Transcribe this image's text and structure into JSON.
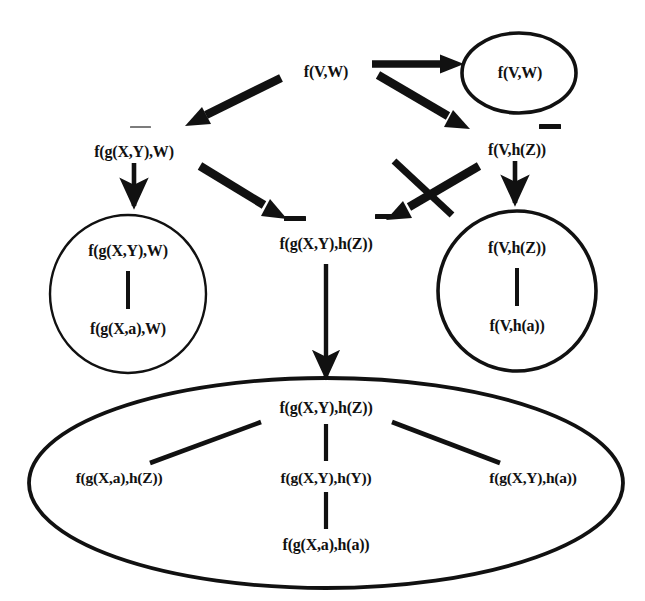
{
  "figure": {
    "background_color": "#ffffff",
    "ink_color": "#111111",
    "width": 645,
    "height": 601
  },
  "nodes": {
    "root": {
      "label": "f(V,W)"
    },
    "top_right_ellipse_node": {
      "label": "f(V,W)"
    },
    "left_mid": {
      "label": "f(g(X,Y),W)"
    },
    "right_mid": {
      "label": "f(V,h(Z))"
    },
    "center": {
      "label": "f(g(X,Y),h(Z))"
    },
    "left_circle_top": {
      "label": "f(g(X,Y),W)"
    },
    "left_circle_bottom": {
      "label": "f(g(X,a),W)"
    },
    "right_circle_top": {
      "label": "f(V,h(Z))"
    },
    "right_circle_bottom": {
      "label": "f(V,h(a))"
    },
    "ellipse_top": {
      "label": "f(g(X,Y),h(Z))"
    },
    "ellipse_left": {
      "label": "f(g(X,a),h(Z))"
    },
    "ellipse_center": {
      "label": "f(g(X,Y),h(Y))"
    },
    "ellipse_right": {
      "label": "f(g(X,Y),h(a))"
    },
    "ellipse_bottom": {
      "label": "f(g(X,a),h(a))"
    }
  },
  "shapes": {
    "top_right_ellipse": {
      "name": "ellipse"
    },
    "left_circle": {
      "name": "circle"
    },
    "right_circle": {
      "name": "circle"
    },
    "bottom_ellipse": {
      "name": "ellipse"
    }
  },
  "edges": {
    "root_to_top_right": {
      "kind": "thick-arrow"
    },
    "root_to_left_mid": {
      "kind": "thick-arrow"
    },
    "root_to_right_mid": {
      "kind": "thick-arrow"
    },
    "left_mid_to_left_circle": {
      "kind": "thin-arrow"
    },
    "left_mid_to_center": {
      "kind": "thick-arrow"
    },
    "right_mid_to_right_circle": {
      "kind": "thin-arrow"
    },
    "right_mid_to_center": {
      "kind": "thick-arrow-crossed-out"
    },
    "center_to_bottom_ellipse": {
      "kind": "thin-arrow"
    },
    "left_circle_link": {
      "kind": "line"
    },
    "right_circle_link": {
      "kind": "line"
    },
    "ellipse_top_to_left": {
      "kind": "line"
    },
    "ellipse_top_to_center": {
      "kind": "line"
    },
    "ellipse_top_to_right": {
      "kind": "line"
    },
    "ellipse_center_to_bottom": {
      "kind": "line"
    }
  },
  "negation_bars": {
    "left_mid": "overline",
    "right_mid": "overline",
    "center_left": "overline",
    "center_right": "overline"
  }
}
